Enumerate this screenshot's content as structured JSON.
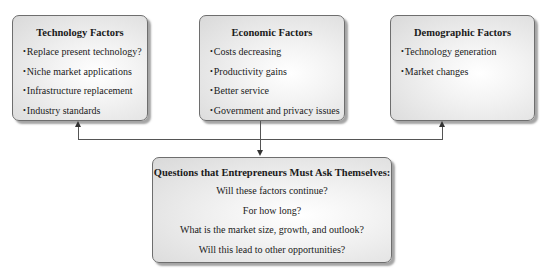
{
  "diagram": {
    "factors": [
      {
        "title": "Technology Factors",
        "items": [
          "Replace present technology?",
          "Niche market applications",
          "Infrastructure replacement",
          "Industry standards"
        ]
      },
      {
        "title": "Economic Factors",
        "items": [
          "Costs decreasing",
          "Productivity gains",
          "Better service",
          "Government and privacy issues"
        ]
      },
      {
        "title": "Demographic Factors",
        "items": [
          "Technology generation",
          "Market changes"
        ]
      }
    ],
    "questions": {
      "title": "Questions that Entrepreneurs Must Ask Themselves:",
      "items": [
        "Will these factors continue?",
        "For how long?",
        "What is the market size, growth, and outlook?",
        "Will this lead to other opportunities?"
      ]
    },
    "colors": {
      "border": "#6e6e6e",
      "connector": "#555555",
      "text": "#1a1a1a"
    }
  }
}
